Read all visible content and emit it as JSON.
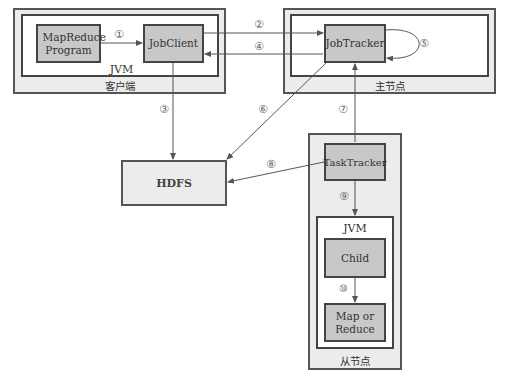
{
  "client": {
    "region_label": "客户端",
    "jvm_label": "JVM",
    "mapreduce_program": "MapReduce Program",
    "job_client": "JobClient"
  },
  "master": {
    "region_label": "主节点",
    "job_tracker": "JobTracker"
  },
  "hdfs": {
    "label": "HDFS"
  },
  "slave": {
    "region_label": "从节点",
    "task_tracker": "TaskTracker",
    "jvm_label": "JVM",
    "child": "Child",
    "map_or_reduce_line1": "Map or",
    "map_or_reduce_line2": "Reduce"
  },
  "steps": {
    "s1": "①",
    "s2": "②",
    "s3": "③",
    "s4": "④",
    "s5": "⑤",
    "s6": "⑥",
    "s7": "⑦",
    "s8": "⑧",
    "s9": "⑨",
    "s10": "⑩"
  },
  "colors": {
    "node_fill": "#c8c8c8",
    "region_fill": "#ececec",
    "border": "#444444",
    "arrow": "#555555"
  }
}
